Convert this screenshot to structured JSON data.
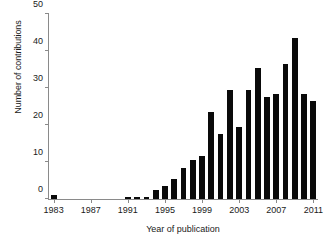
{
  "chart_data": {
    "type": "bar",
    "title": "",
    "xlabel": "Year of publication",
    "ylabel": "Number of contributions",
    "categories": [
      1983,
      1984,
      1985,
      1986,
      1987,
      1988,
      1989,
      1990,
      1991,
      1992,
      1993,
      1994,
      1995,
      1996,
      1997,
      1998,
      1999,
      2000,
      2001,
      2002,
      2003,
      2004,
      2005,
      2006,
      2007,
      2008,
      2009,
      2010,
      2011
    ],
    "values": [
      1,
      0,
      0,
      0,
      0,
      0,
      0,
      0,
      0.5,
      0.5,
      0.5,
      2.5,
      3.5,
      5.5,
      8.5,
      10.5,
      11.5,
      23.5,
      17.5,
      29.5,
      19.5,
      29.5,
      35.5,
      27.5,
      28.5,
      36.5,
      43.5,
      28.5,
      26.5
    ],
    "xlim": [
      1982.5,
      2011.5
    ],
    "ylim": [
      0,
      50
    ],
    "yticks": [
      0,
      10,
      20,
      30,
      40,
      50
    ],
    "ytick_labels": [
      "0",
      "10",
      "20",
      "30",
      "40",
      "50"
    ],
    "xticks": [
      1983,
      1987,
      1991,
      1995,
      1999,
      2003,
      2007,
      2011
    ],
    "xtick_labels": [
      "1983",
      "1987",
      "1991",
      "1995",
      "1999",
      "2003",
      "2007",
      "2011"
    ],
    "grid": false,
    "legend": false,
    "bar_color": "#0a0a0a",
    "axis_color": "#8a8a8a",
    "background": "#ffffff"
  }
}
